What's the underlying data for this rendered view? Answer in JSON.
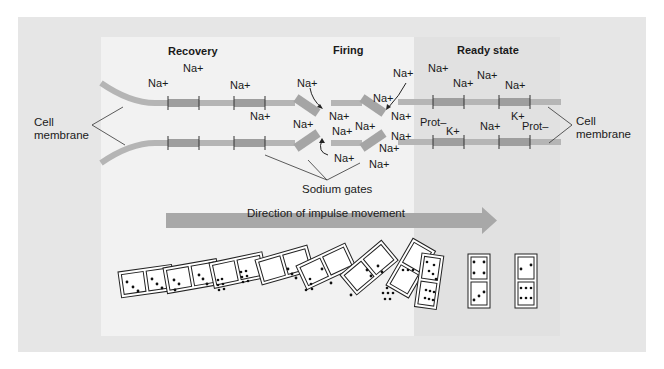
{
  "sections": {
    "recovery": "Recovery",
    "firing": "Firing",
    "ready": "Ready state"
  },
  "labels": {
    "cell_membrane_left": [
      "Cell",
      "membrane"
    ],
    "cell_membrane_right": [
      "Cell",
      "membrane"
    ],
    "sodium_gates": "Sodium gates",
    "direction": "Direction of impulse movement"
  },
  "ions": [
    {
      "text": "Na+",
      "x": 183,
      "y": 62
    },
    {
      "text": "Na+",
      "x": 148,
      "y": 77
    },
    {
      "text": "Na+",
      "x": 230,
      "y": 79
    },
    {
      "text": "Na+",
      "x": 250,
      "y": 110
    },
    {
      "text": "Na+",
      "x": 297,
      "y": 77
    },
    {
      "text": "Na+",
      "x": 293,
      "y": 118
    },
    {
      "text": "Na+",
      "x": 329,
      "y": 110
    },
    {
      "text": "Na+",
      "x": 332,
      "y": 125
    },
    {
      "text": "Na+",
      "x": 355,
      "y": 120
    },
    {
      "text": "Na+",
      "x": 334,
      "y": 152
    },
    {
      "text": "Na+",
      "x": 373,
      "y": 92
    },
    {
      "text": "Na+",
      "x": 393,
      "y": 67
    },
    {
      "text": "Na+",
      "x": 391,
      "y": 110
    },
    {
      "text": "Na+",
      "x": 391,
      "y": 130
    },
    {
      "text": "Na+",
      "x": 379,
      "y": 142
    },
    {
      "text": "Na+",
      "x": 369,
      "y": 158
    },
    {
      "text": "Na+",
      "x": 428,
      "y": 62
    },
    {
      "text": "Na+",
      "x": 453,
      "y": 77
    },
    {
      "text": "Na+",
      "x": 477,
      "y": 69
    },
    {
      "text": "Na+",
      "x": 505,
      "y": 79
    },
    {
      "text": "Prot–",
      "x": 420,
      "y": 116
    },
    {
      "text": "K+",
      "x": 446,
      "y": 125
    },
    {
      "text": "Na+",
      "x": 480,
      "y": 120
    },
    {
      "text": "K+",
      "x": 511,
      "y": 110
    },
    {
      "text": "Prot–",
      "x": 522,
      "y": 120
    }
  ],
  "colors": {
    "outer_bg": "#e6e6e6",
    "panel_light": "#f2f2f2",
    "panel_ready": "#e1e1e1",
    "membrane": "#b5b5b5",
    "membrane_dark": "#9e9e9e",
    "arrow": "#a8a8a8"
  }
}
